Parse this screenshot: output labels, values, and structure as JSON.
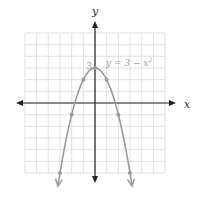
{
  "chart_data": {
    "type": "line",
    "title": "",
    "xlabel": "x",
    "ylabel": "y",
    "xlim": [
      -6,
      6
    ],
    "ylim": [
      -6,
      6
    ],
    "grid": true,
    "series": [
      {
        "name": "y = 3 - x^2",
        "equation": "y = 3 − x²",
        "points": [
          {
            "x": -3,
            "y": -6
          },
          {
            "x": -2,
            "y": -1
          },
          {
            "x": -1,
            "y": 2
          },
          {
            "x": 0,
            "y": 3
          },
          {
            "x": 1,
            "y": 2
          },
          {
            "x": 2,
            "y": -1
          },
          {
            "x": 3,
            "y": -6
          }
        ]
      }
    ],
    "annotations": [
      {
        "text": "3",
        "x": 0,
        "y": 3,
        "note": "y-intercept label"
      },
      {
        "text": "y = 3 − x²",
        "position": "upper right of vertex"
      }
    ]
  },
  "labels": {
    "x_axis": "x",
    "y_axis": "y",
    "intercept": "3",
    "equation_prefix": "y = 3 − x",
    "equation_exp": "2"
  },
  "colors": {
    "grid": "#d9d9d9",
    "axis": "#222222",
    "curve": "#9a9a9a",
    "text": "#9a9a9a",
    "axis_label": "#333333"
  }
}
